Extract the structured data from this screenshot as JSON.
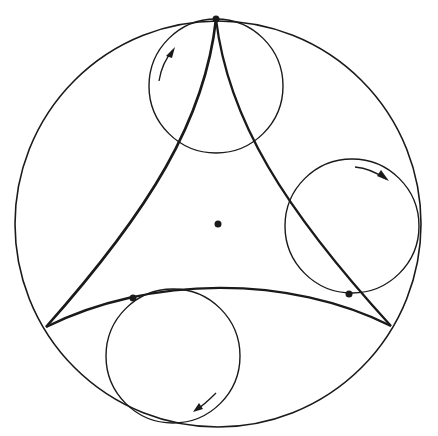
{
  "figure": {
    "colors": {
      "stroke": "#1a1a1a",
      "background": "#ffffff"
    },
    "outer_circle": {
      "cx": 218,
      "cy": 224,
      "r": 203
    },
    "rolling_circles": [
      {
        "name": "top",
        "cx": 216,
        "cy": 86,
        "r": 67,
        "arrow": "counterclockwise"
      },
      {
        "name": "right",
        "cx": 352,
        "cy": 226,
        "r": 67,
        "arrow": "clockwise"
      },
      {
        "name": "bottom",
        "cx": 173,
        "cy": 356,
        "r": 67,
        "arrow": "clockwise"
      }
    ],
    "cusps": [
      [
        216,
        19
      ],
      [
        46,
        327
      ],
      [
        391,
        326
      ]
    ],
    "points": [
      {
        "name": "center",
        "x": 218,
        "y": 224
      },
      {
        "name": "top-cusp",
        "x": 216,
        "y": 19
      },
      {
        "name": "left-tangent",
        "x": 133,
        "y": 298
      },
      {
        "name": "right-tangent",
        "x": 349,
        "y": 294
      }
    ]
  }
}
